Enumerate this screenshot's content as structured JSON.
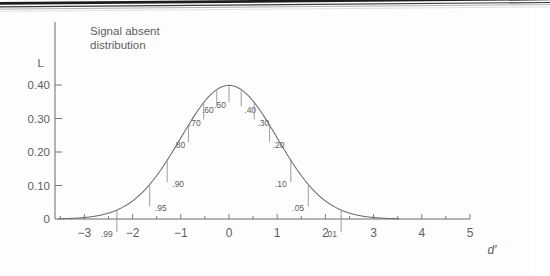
{
  "figure": {
    "title_lines": [
      "Signal absent",
      "distribution"
    ],
    "background_color": "#fdfdfd",
    "ink_color": "#5d5d60"
  },
  "axes": {
    "y_axis_name": "L",
    "x_axis_name": "d′",
    "y_ticks": [
      "0.40",
      "0.30",
      "0.20",
      "0.10",
      "0"
    ],
    "x_ticks": [
      "−3",
      "−2",
      "−1",
      "0",
      "1",
      "2",
      "3",
      "4",
      "5"
    ]
  },
  "chart_data": {
    "type": "line",
    "title": "Signal absent distribution",
    "xlabel": "d′",
    "ylabel": "L",
    "xlim": [
      -3.5,
      5.0
    ],
    "ylim": [
      0,
      0.44
    ],
    "grid": false,
    "legend": null,
    "curve_description": "standard normal probability density, mean 0, sd 1",
    "x_tick_values": [
      -3,
      -2,
      -1,
      0,
      1,
      2,
      3,
      4,
      5
    ],
    "y_tick_values": [
      0.4,
      0.3,
      0.2,
      0.1,
      0
    ],
    "series": [
      {
        "name": "Signal absent distribution",
        "x": [
          -3.5,
          -3.25,
          -3.0,
          -2.75,
          -2.5,
          -2.25,
          -2.0,
          -1.75,
          -1.5,
          -1.25,
          -1.0,
          -0.75,
          -0.5,
          -0.25,
          0.0,
          0.25,
          0.5,
          0.75,
          1.0,
          1.25,
          1.5,
          1.75,
          2.0,
          2.25,
          2.5,
          2.75,
          3.0,
          3.25,
          3.5
        ],
        "y": [
          0.0009,
          0.002,
          0.0044,
          0.0091,
          0.0175,
          0.0317,
          0.054,
          0.0863,
          0.1295,
          0.1826,
          0.242,
          0.3011,
          0.3521,
          0.3867,
          0.3989,
          0.3867,
          0.3521,
          0.3011,
          0.242,
          0.1826,
          0.1295,
          0.0863,
          0.054,
          0.0317,
          0.0175,
          0.0091,
          0.0044,
          0.002,
          0.0009
        ]
      }
    ],
    "annotations": [
      {
        "label": ".99",
        "p": 0.99,
        "z": -2.326,
        "density": 0.0267,
        "label_side": "left"
      },
      {
        "label": ".95",
        "p": 0.95,
        "z": -1.645,
        "density": 0.1031,
        "label_side": "right"
      },
      {
        "label": ".90",
        "p": 0.9,
        "z": -1.282,
        "density": 0.1755,
        "label_side": "right"
      },
      {
        "label": ".80",
        "p": 0.8,
        "z": -0.842,
        "density": 0.28,
        "label_side": "left"
      },
      {
        "label": ".70",
        "p": 0.7,
        "z": -0.524,
        "density": 0.3477,
        "label_side": "left"
      },
      {
        "label": ".60",
        "p": 0.6,
        "z": -0.253,
        "density": 0.3863,
        "label_side": "left"
      },
      {
        "label": ".50",
        "p": 0.5,
        "z": 0.0,
        "density": 0.3989,
        "label_side": "left"
      },
      {
        "label": ".40",
        "p": 0.4,
        "z": 0.253,
        "density": 0.3863,
        "label_side": "right"
      },
      {
        "label": ".30",
        "p": 0.3,
        "z": 0.524,
        "density": 0.3477,
        "label_side": "right"
      },
      {
        "label": ".20",
        "p": 0.2,
        "z": 0.842,
        "density": 0.28,
        "label_side": "right"
      },
      {
        "label": ".10",
        "p": 0.1,
        "z": 1.282,
        "density": 0.1755,
        "label_side": "left"
      },
      {
        "label": ".05",
        "p": 0.05,
        "z": 1.645,
        "density": 0.1031,
        "label_side": "left"
      },
      {
        "label": ".01",
        "p": 0.01,
        "z": 2.326,
        "density": 0.0267,
        "label_side": "left"
      }
    ]
  }
}
